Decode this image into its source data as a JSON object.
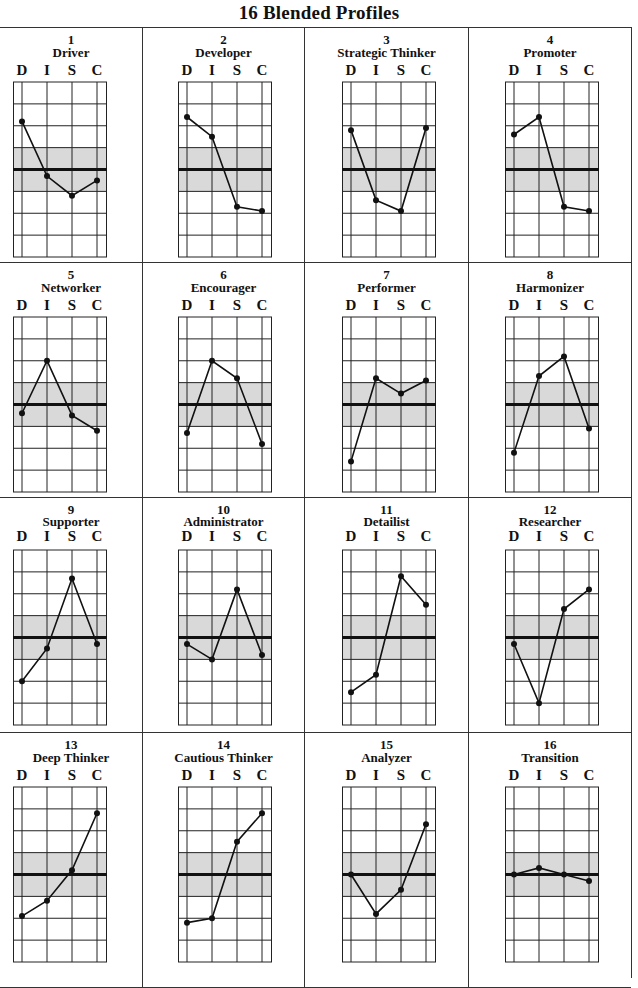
{
  "page": {
    "title": "16 Blended Profiles"
  },
  "axis_letters": [
    "D",
    "I",
    "S",
    "C"
  ],
  "colors": {
    "line": "#111111",
    "grid": "#222222",
    "band": "#d9d9d9",
    "border": "#333333"
  },
  "profiles": [
    {
      "number": "1",
      "name": "Driver"
    },
    {
      "number": "2",
      "name": "Developer"
    },
    {
      "number": "3",
      "name": "Strategic Thinker"
    },
    {
      "number": "4",
      "name": "Promoter"
    },
    {
      "number": "5",
      "name": "Networker"
    },
    {
      "number": "6",
      "name": "Encourager"
    },
    {
      "number": "7",
      "name": "Performer"
    },
    {
      "number": "8",
      "name": "Harmonizer"
    },
    {
      "number": "9",
      "name": "Supporter"
    },
    {
      "number": "10",
      "name": "Administrator"
    },
    {
      "number": "11",
      "name": "Detailist"
    },
    {
      "number": "12",
      "name": "Researcher"
    },
    {
      "number": "13",
      "name": "Deep Thinker"
    },
    {
      "number": "14",
      "name": "Cautious Thinker"
    },
    {
      "number": "15",
      "name": "Analyzer"
    },
    {
      "number": "16",
      "name": "Transition"
    }
  ],
  "chart_data": {
    "type": "line",
    "title": "16 Blended Profiles",
    "categories": [
      "D",
      "I",
      "S",
      "C"
    ],
    "ylabel": "",
    "xlabel": "",
    "ylim": [
      -4,
      4
    ],
    "grid": true,
    "midline": 0,
    "shaded_band": [
      -1,
      1
    ],
    "layout": {
      "rows": 4,
      "cols": 4
    },
    "series": [
      {
        "name": "1 Driver",
        "values": [
          2.2,
          -0.3,
          -1.2,
          -0.5
        ]
      },
      {
        "name": "2 Developer",
        "values": [
          2.4,
          1.5,
          -1.7,
          -1.9
        ]
      },
      {
        "name": "3 Strategic Thinker",
        "values": [
          1.8,
          -1.4,
          -1.9,
          1.9
        ]
      },
      {
        "name": "4 Promoter",
        "values": [
          1.6,
          2.4,
          -1.7,
          -1.9
        ]
      },
      {
        "name": "5 Networker",
        "values": [
          -0.4,
          2.0,
          -0.5,
          -1.2
        ]
      },
      {
        "name": "6 Encourager",
        "values": [
          -1.3,
          2.0,
          1.2,
          -1.8
        ]
      },
      {
        "name": "7 Performer",
        "values": [
          -2.6,
          1.2,
          0.5,
          1.1
        ]
      },
      {
        "name": "8 Harmonizer",
        "values": [
          -2.2,
          1.3,
          2.2,
          -1.1
        ]
      },
      {
        "name": "9 Supporter",
        "values": [
          -2.0,
          -0.5,
          2.7,
          -0.3
        ]
      },
      {
        "name": "10 Administrator",
        "values": [
          -0.3,
          -1.0,
          2.2,
          -0.8
        ]
      },
      {
        "name": "11 Detailist",
        "values": [
          -2.5,
          -1.7,
          2.8,
          1.5
        ]
      },
      {
        "name": "12 Researcher",
        "values": [
          -0.3,
          -3.0,
          1.3,
          2.2
        ]
      },
      {
        "name": "13 Deep Thinker",
        "values": [
          -1.9,
          -1.2,
          0.2,
          2.8
        ]
      },
      {
        "name": "14 Cautious Thinker",
        "values": [
          -2.2,
          -2.0,
          1.5,
          2.8
        ]
      },
      {
        "name": "15 Analyzer",
        "values": [
          0.0,
          -1.8,
          -0.7,
          2.3
        ]
      },
      {
        "name": "16 Transition",
        "values": [
          0.0,
          0.3,
          0.0,
          -0.3
        ]
      }
    ]
  }
}
